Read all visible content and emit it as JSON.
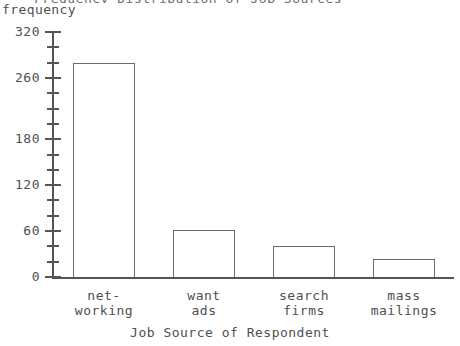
{
  "figure": {
    "clipped_top_title": "Frequency Distribution of Job Sources",
    "y_axis_caption": "frequency",
    "x_axis_title": "Job Source of Respondent"
  },
  "chart_data": {
    "type": "bar",
    "title": "",
    "xlabel": "Job Source of Respondent",
    "ylabel": "frequency",
    "categories": [
      "net-\nworking",
      "want\nads",
      "search\nfirms",
      "mass\nmailings"
    ],
    "category_labels_flat": [
      "net-working",
      "want ads",
      "search firms",
      "mass mailings"
    ],
    "values": [
      280,
      61,
      41,
      24
    ],
    "ylim": [
      0,
      320
    ],
    "yticks_major": [
      0,
      60,
      120,
      180,
      260,
      320
    ],
    "ytick_labels": [
      "0",
      "60",
      "120",
      "180",
      "260",
      "320"
    ],
    "ytick_minor_step": 20,
    "grid": false,
    "legend": null,
    "bar_fill": "#ffffff",
    "bar_edge": "#6a6a6a",
    "axis_color": "#555555",
    "text_color": "#4f4f4f"
  },
  "yticks": [
    {
      "value": "320",
      "top": 32,
      "major": true
    },
    {
      "value": "",
      "top": 47,
      "major": false
    },
    {
      "value": "",
      "top": 62,
      "major": false
    },
    {
      "value": "",
      "top": 77,
      "major": false
    },
    {
      "value": "260",
      "top": 87,
      "major": true
    },
    {
      "value": "",
      "top": 103,
      "major": false
    },
    {
      "value": "",
      "top": 118,
      "major": false
    },
    {
      "value": "",
      "top": 133,
      "major": false
    },
    {
      "value": "180",
      "top": 148,
      "major": true
    },
    {
      "value": "",
      "top": 164,
      "major": false
    },
    {
      "value": "",
      "top": 179,
      "major": false
    },
    {
      "value": "",
      "top": 194,
      "major": false
    },
    {
      "value": "120",
      "top": 186,
      "major": true
    },
    {
      "value": "60",
      "top": 229,
      "major": true
    },
    {
      "value": "0",
      "top": 277,
      "major": true
    }
  ]
}
